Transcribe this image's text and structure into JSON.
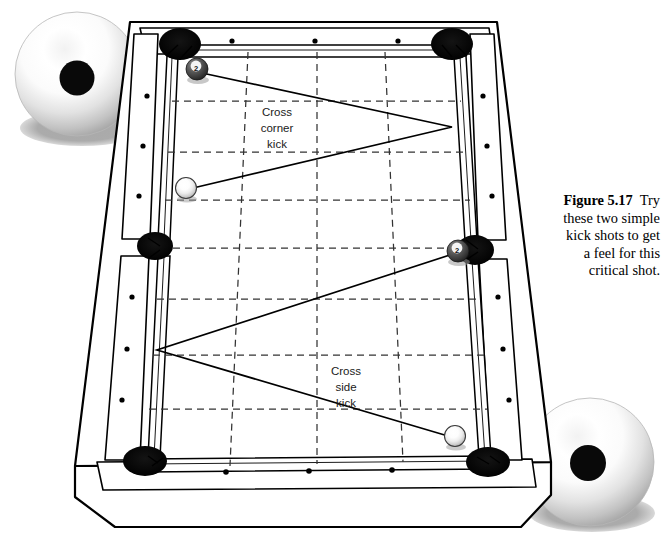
{
  "figure": {
    "number": "Figure 5.17",
    "caption_text": "Try these two simple kick shots to get a feel for this critical shot.",
    "caption_line1": "Try",
    "caption_line2": "these two simple",
    "caption_line3": "kick shots to get",
    "caption_line4": "a feel for this",
    "caption_line5": "critical shot."
  },
  "diagram": {
    "view": "three-quarter-perspective",
    "surface_color": "#ffffff",
    "line_color": "#000000",
    "pocket_color": "#000000",
    "grid_color": "#3a3a3a",
    "object_ball_color": "#4a4a4a",
    "cue_ball_color": "#ffffff"
  },
  "labels": {
    "cross_corner": {
      "line1": "Cross",
      "line2": "corner",
      "line3": "kick"
    },
    "cross_side": {
      "line1": "Cross",
      "line2": "side",
      "line3": "kick"
    }
  },
  "balls": {
    "object_ball_number": "2",
    "object_balls": [
      {
        "name": "two-ball-top-left",
        "number": "2",
        "x": 197,
        "y": 69
      },
      {
        "name": "two-ball-right-side",
        "number": "2",
        "x": 458,
        "y": 251
      }
    ],
    "cue_balls": [
      {
        "name": "cue-ball-left",
        "x": 186,
        "y": 188
      },
      {
        "name": "cue-ball-bottom-right",
        "x": 455,
        "y": 436
      }
    ]
  },
  "pockets": [
    {
      "name": "pocket-top-left",
      "x": 180,
      "y": 44
    },
    {
      "name": "pocket-top-right",
      "x": 451,
      "y": 44
    },
    {
      "name": "pocket-side-left",
      "x": 155,
      "y": 245
    },
    {
      "name": "pocket-side-right",
      "x": 477,
      "y": 250
    },
    {
      "name": "pocket-bottom-left",
      "x": 144,
      "y": 460
    },
    {
      "name": "pocket-bottom-right",
      "x": 489,
      "y": 463
    }
  ],
  "shots": [
    {
      "name": "cross-corner-kick",
      "label": "Cross corner kick",
      "path": [
        [
          191,
          72
        ],
        [
          452,
          127
        ],
        [
          190,
          187
        ]
      ]
    },
    {
      "name": "cross-side-kick",
      "label": "Cross side kick",
      "path": [
        [
          456,
          254
        ],
        [
          157,
          349
        ],
        [
          451,
          436
        ]
      ]
    }
  ],
  "cue_ball_illustrations": [
    {
      "name": "cue-ball-illustration-top-left",
      "cx": 77,
      "cy": 74,
      "r": 62
    },
    {
      "name": "cue-ball-illustration-bottom-right",
      "cx": 590,
      "cy": 462,
      "r": 64
    }
  ],
  "rail_sight_dots": {
    "top_count": 3,
    "bottom_count": 3,
    "left_upper_count": 3,
    "left_lower_count": 3,
    "right_upper_count": 3,
    "right_lower_count": 3
  }
}
